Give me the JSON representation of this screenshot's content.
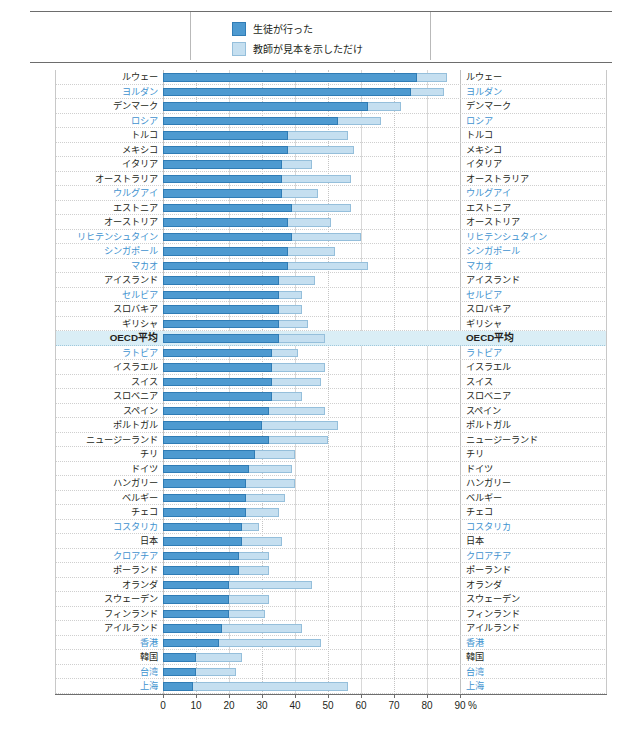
{
  "header": {
    "cut_text": "——  ———  ————  ——  ————————  ————  ——————————"
  },
  "legend": {
    "items": [
      {
        "label": "生徒が行った",
        "color": "#4e9ad0"
      },
      {
        "label": "教師が見本を示しただけ",
        "color": "#c5dff0"
      }
    ]
  },
  "chart_data": {
    "type": "bar",
    "orientation": "horizontal",
    "stacked": false,
    "overlay": true,
    "title": "",
    "xlabel": "%",
    "ylabel": "",
    "xlim": [
      0,
      90
    ],
    "xticks": [
      0,
      10,
      20,
      30,
      40,
      50,
      60,
      70,
      80,
      90
    ],
    "xtick_labels": [
      "0",
      "10",
      "20",
      "30",
      "40",
      "50",
      "60",
      "70",
      "80",
      "90"
    ],
    "unit_suffix": "%",
    "grid": true,
    "legend_position": "top-center",
    "series": [
      {
        "name": "生徒が行った",
        "color": "#4e9ad0"
      },
      {
        "name": "教師が見本を示しただけ",
        "color": "#c5dff0"
      }
    ],
    "categories": [
      "ルウェー",
      "ヨルダン",
      "デンマーク",
      "ロシア",
      "トルコ",
      "メキシコ",
      "イタリア",
      "オーストラリア",
      "ウルグアイ",
      "エストニア",
      "オーストリア",
      "リヒテンシュタイン",
      "シンガポール",
      "マカオ",
      "アイスランド",
      "セルビア",
      "スロバキア",
      "ギリシャ",
      "OECD平均",
      "ラトビア",
      "イスラエル",
      "スイス",
      "スロベニア",
      "スペイン",
      "ポルトガル",
      "ニュージーランド",
      "チリ",
      "ドイツ",
      "ハンガリー",
      "ベルギー",
      "チェコ",
      "コスタリカ",
      "日本",
      "クロアチア",
      "ポーランド",
      "オランダ",
      "スウェーデン",
      "フィンランド",
      "アイルランド",
      "香港",
      "韓国",
      "台湾",
      "上海"
    ],
    "non_oecd": [
      "ヨルダン",
      "ロシア",
      "ウルグアイ",
      "リヒテンシュタイン",
      "シンガポール",
      "マカオ",
      "セルビア",
      "ラトビア",
      "コスタリカ",
      "クロアチア",
      "香港",
      "台湾",
      "上海"
    ],
    "highlight_row": "OECD平均",
    "rows": [
      {
        "category": "ルウェー",
        "students": 77,
        "teacher_only": 86
      },
      {
        "category": "ヨルダン",
        "students": 75,
        "teacher_only": 85
      },
      {
        "category": "デンマーク",
        "students": 62,
        "teacher_only": 72
      },
      {
        "category": "ロシア",
        "students": 53,
        "teacher_only": 66
      },
      {
        "category": "トルコ",
        "students": 38,
        "teacher_only": 56
      },
      {
        "category": "メキシコ",
        "students": 38,
        "teacher_only": 58
      },
      {
        "category": "イタリア",
        "students": 36,
        "teacher_only": 45
      },
      {
        "category": "オーストラリア",
        "students": 36,
        "teacher_only": 57
      },
      {
        "category": "ウルグアイ",
        "students": 36,
        "teacher_only": 47
      },
      {
        "category": "エストニア",
        "students": 39,
        "teacher_only": 57
      },
      {
        "category": "オーストリア",
        "students": 38,
        "teacher_only": 51
      },
      {
        "category": "リヒテンシュタイン",
        "students": 39,
        "teacher_only": 60
      },
      {
        "category": "シンガポール",
        "students": 38,
        "teacher_only": 52
      },
      {
        "category": "マカオ",
        "students": 38,
        "teacher_only": 62
      },
      {
        "category": "アイスランド",
        "students": 35,
        "teacher_only": 46
      },
      {
        "category": "セルビア",
        "students": 35,
        "teacher_only": 42
      },
      {
        "category": "スロバキア",
        "students": 35,
        "teacher_only": 42
      },
      {
        "category": "ギリシャ",
        "students": 35,
        "teacher_only": 44
      },
      {
        "category": "OECD平均",
        "students": 35,
        "teacher_only": 49
      },
      {
        "category": "ラトビア",
        "students": 33,
        "teacher_only": 41
      },
      {
        "category": "イスラエル",
        "students": 33,
        "teacher_only": 49
      },
      {
        "category": "スイス",
        "students": 33,
        "teacher_only": 48
      },
      {
        "category": "スロベニア",
        "students": 33,
        "teacher_only": 42
      },
      {
        "category": "スペイン",
        "students": 32,
        "teacher_only": 49
      },
      {
        "category": "ポルトガル",
        "students": 30,
        "teacher_only": 53
      },
      {
        "category": "ニュージーランド",
        "students": 32,
        "teacher_only": 50
      },
      {
        "category": "チリ",
        "students": 28,
        "teacher_only": 40
      },
      {
        "category": "ドイツ",
        "students": 26,
        "teacher_only": 39
      },
      {
        "category": "ハンガリー",
        "students": 25,
        "teacher_only": 40
      },
      {
        "category": "ベルギー",
        "students": 25,
        "teacher_only": 37
      },
      {
        "category": "チェコ",
        "students": 25,
        "teacher_only": 35
      },
      {
        "category": "コスタリカ",
        "students": 24,
        "teacher_only": 29
      },
      {
        "category": "日本",
        "students": 24,
        "teacher_only": 36
      },
      {
        "category": "クロアチア",
        "students": 23,
        "teacher_only": 32
      },
      {
        "category": "ポーランド",
        "students": 23,
        "teacher_only": 32
      },
      {
        "category": "オランダ",
        "students": 20,
        "teacher_only": 45
      },
      {
        "category": "スウェーデン",
        "students": 20,
        "teacher_only": 32
      },
      {
        "category": "フィンランド",
        "students": 20,
        "teacher_only": 31
      },
      {
        "category": "アイルランド",
        "students": 18,
        "teacher_only": 42
      },
      {
        "category": "香港",
        "students": 17,
        "teacher_only": 48
      },
      {
        "category": "韓国",
        "students": 10,
        "teacher_only": 24
      },
      {
        "category": "台湾",
        "students": 10,
        "teacher_only": 22
      },
      {
        "category": "上海",
        "students": 9,
        "teacher_only": 56
      }
    ]
  }
}
